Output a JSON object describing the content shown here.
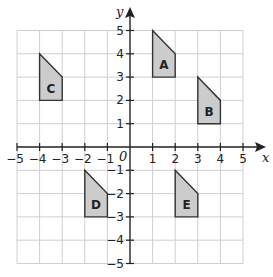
{
  "diagram": {
    "x_axis_label": "x",
    "y_axis_label": "y",
    "origin_label": "0",
    "x_range": [
      -5,
      5
    ],
    "y_range": [
      -5,
      5
    ],
    "x_ticks": [
      "-5",
      "-4",
      "-3",
      "-2",
      "-1",
      "1",
      "2",
      "3",
      "4",
      "5"
    ],
    "y_ticks": [
      "5",
      "4",
      "3",
      "2",
      "1",
      "-1",
      "-2",
      "-3",
      "-4",
      "-5"
    ],
    "shape_fill": "#cccccc",
    "shapes": [
      {
        "label": "A",
        "vertices": [
          [
            1,
            5
          ],
          [
            2,
            4
          ],
          [
            2,
            3
          ],
          [
            1,
            3
          ]
        ]
      },
      {
        "label": "B",
        "vertices": [
          [
            3,
            3
          ],
          [
            4,
            2
          ],
          [
            4,
            1
          ],
          [
            3,
            1
          ]
        ]
      },
      {
        "label": "C",
        "vertices": [
          [
            -4,
            4
          ],
          [
            -3,
            3
          ],
          [
            -3,
            2
          ],
          [
            -4,
            2
          ]
        ]
      },
      {
        "label": "D",
        "vertices": [
          [
            -2,
            -1
          ],
          [
            -1,
            -2
          ],
          [
            -1,
            -3
          ],
          [
            -2,
            -3
          ]
        ]
      },
      {
        "label": "E",
        "vertices": [
          [
            2,
            -1
          ],
          [
            3,
            -2
          ],
          [
            3,
            -3
          ],
          [
            2,
            -3
          ]
        ]
      }
    ]
  }
}
